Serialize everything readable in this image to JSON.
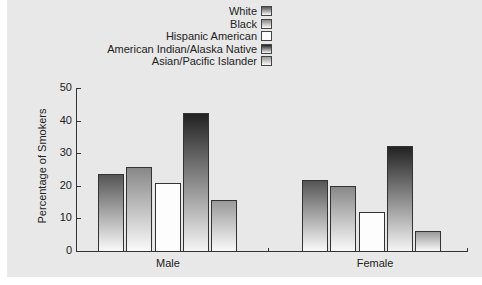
{
  "chart_data": {
    "type": "bar",
    "title": "",
    "xlabel": "",
    "ylabel": "Percentage of Smokers",
    "ylim": [
      0,
      50
    ],
    "yticks": [
      0,
      10,
      20,
      30,
      40,
      50
    ],
    "categories": [
      "Male",
      "Female"
    ],
    "series": [
      {
        "name": "White",
        "values": [
          23.6,
          21.8
        ]
      },
      {
        "name": "Black",
        "values": [
          25.8,
          20.0
        ]
      },
      {
        "name": "Hispanic American",
        "values": [
          20.9,
          12.0
        ]
      },
      {
        "name": "American Indian/Alaska Native",
        "values": [
          42.3,
          32.2
        ]
      },
      {
        "name": "Asian/Pacific Islander",
        "values": [
          15.6,
          6.1
        ]
      }
    ],
    "legend_position": "top",
    "grid": false
  },
  "legend": [
    "White",
    "Black",
    "Hispanic American",
    "American Indian/Alaska Native",
    "Asian/Pacific Islander"
  ],
  "ylabel": "Percentage of Smokers",
  "ticks": [
    "0",
    "10",
    "20",
    "30",
    "40",
    "50"
  ],
  "categories": [
    "Male",
    "Female"
  ]
}
